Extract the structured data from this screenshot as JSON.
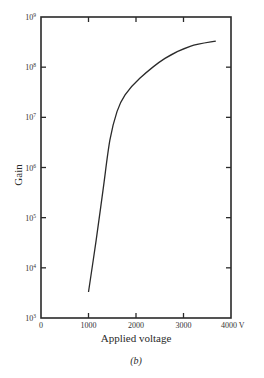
{
  "chart_data": {
    "type": "line",
    "title": "",
    "caption": "(b)",
    "xlabel": "Applied voltage",
    "ylabel": "Gain",
    "x_unit": "V",
    "xlim": [
      0,
      4000
    ],
    "ylim": [
      1000,
      1000000000
    ],
    "yscale": "log",
    "grid": false,
    "legend": null,
    "x_ticks": [
      0,
      1000,
      2000,
      3000,
      4000
    ],
    "x_tick_labels": [
      "0",
      "1000",
      "2000",
      "3000",
      "4000 V"
    ],
    "y_ticks_exp": [
      3,
      4,
      5,
      6,
      7,
      8,
      9
    ],
    "y_tick_labels": [
      "10",
      "10",
      "10",
      "10",
      "10",
      "10",
      "10"
    ],
    "y_tick_sups": [
      "3",
      "4",
      "5",
      "6",
      "7",
      "8",
      "9"
    ],
    "series": [
      {
        "name": "Gain",
        "x": [
          1000,
          1160,
          1305,
          1450,
          1600,
          1770,
          2080,
          2610,
          3140,
          3680
        ],
        "values": [
          3300,
          35000,
          350000,
          3500000,
          13000000,
          28000000,
          60000000,
          150000000,
          260000000,
          330000000
        ]
      }
    ]
  },
  "colors": {
    "ink": "#2a2a2a",
    "background": "#ffffff"
  }
}
